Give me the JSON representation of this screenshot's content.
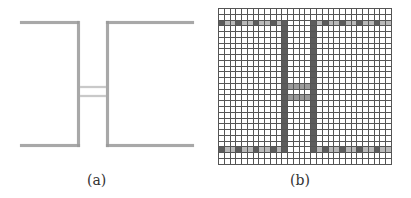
{
  "figure": {
    "panel_a": {
      "caption": "(a)",
      "description": "hand-drawn sketch of two facing rectangles connected by a short double-line bridge"
    },
    "panel_b": {
      "caption": "(b)",
      "grid": {
        "cols": 30,
        "rows": 27,
        "cell_px": 5.77,
        "top_band_row": 2,
        "bottom_band_row": 24,
        "left_bar_col": 11,
        "right_bar_col": 16,
        "bridge_rows": [
          13,
          15
        ],
        "bridge_cols": [
          12,
          15
        ]
      }
    },
    "colors": {
      "grid_line": "#555555",
      "filled_dark": "#5c5c5c",
      "filled_mid": "#9b9b9b",
      "filled_light": "#b9b9b9",
      "sketch_stroke": "#9a9a9a"
    }
  }
}
